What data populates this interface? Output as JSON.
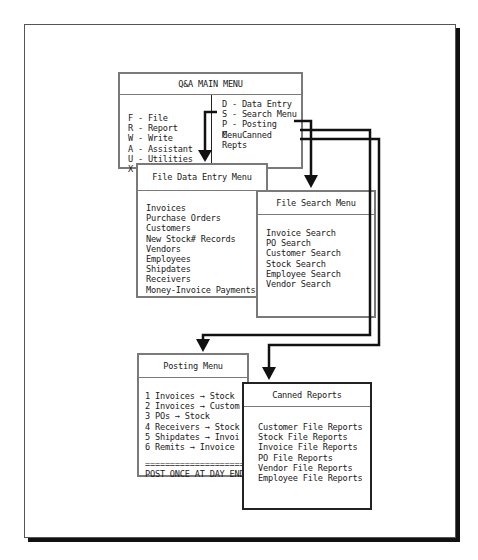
{
  "main_menu": {
    "title": "Q&A MAIN MENU",
    "left_items": [
      {
        "key": "F",
        "label": "F - File"
      },
      {
        "key": "R",
        "label": "R - Report"
      },
      {
        "key": "W",
        "label": "W - Write"
      },
      {
        "key": "A",
        "label": "A - Assistant"
      },
      {
        "key": "U",
        "label": "U - Utilities"
      },
      {
        "key": "X",
        "label": "X - Exit Q&A"
      }
    ],
    "right_items": [
      {
        "key": "D",
        "label": "D - Data Entry"
      },
      {
        "key": "S",
        "label": "S - Search Menu"
      },
      {
        "key": "P",
        "label": "P - Posting Menu"
      },
      {
        "key": "C",
        "label": "C - Canned Repts"
      }
    ]
  },
  "data_entry_menu": {
    "title": "File Data Entry Menu",
    "items": [
      "Invoices",
      "Purchase Orders",
      "Customers",
      "New Stock# Records",
      "Vendors",
      "Employees",
      "Shipdates",
      "Receivers",
      "Money-Invoice Payments"
    ]
  },
  "search_menu": {
    "title": "File Search Menu",
    "items": [
      "Invoice Search",
      "PO Search",
      "Customer Search",
      "Stock Search",
      "Employee Search",
      "Vendor Search"
    ]
  },
  "posting_menu": {
    "title": "Posting Menu",
    "items": [
      "1 Invoices → Stock",
      "2 Invoices → Custom",
      "3 POs → Stock",
      "4 Receivers → Stock",
      "5 Shipdates → Invoi",
      "6 Remits → Invoice"
    ],
    "separator": "======================",
    "footer": "POST ONCE AT DAY END"
  },
  "canned_reports": {
    "title": "Canned Reports",
    "items": [
      "Customer File Reports",
      "Stock File Reports",
      "Invoice File Reports",
      "PO File Reports",
      "Vendor File Reports",
      "Employee File Reports"
    ]
  },
  "connections": [
    {
      "from": "D - Data Entry",
      "to": "File Data Entry Menu"
    },
    {
      "from": "S - Search Menu",
      "to": "File Search Menu"
    },
    {
      "from": "P - Posting Menu",
      "to": "Posting Menu"
    },
    {
      "from": "C - Canned Repts",
      "to": "Canned Reports"
    }
  ]
}
